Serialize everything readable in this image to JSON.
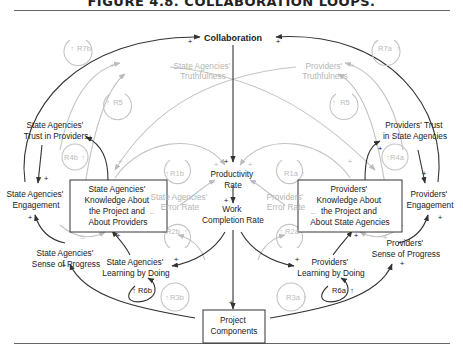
{
  "figure": {
    "title": "FIGURE 4.8. COLLABORATION LOOPS."
  },
  "nodes": {
    "collaboration": "Collaboration",
    "sa_truthfulness": [
      "State Agencies'",
      "Truthfulness"
    ],
    "pr_truthfulness": [
      "Providers'",
      "Truthfulness"
    ],
    "sa_trust": [
      "State Agencies'",
      "Trust in Providers"
    ],
    "pr_trust": [
      "Providers' Trust",
      "in State Agencies"
    ],
    "sa_engagement": [
      "State Agencies'",
      "Engagement"
    ],
    "pr_engagement": [
      "Providers'",
      "Engagement"
    ],
    "sa_knowledge": [
      "State Agencies'",
      "Knowledge About",
      "the Project and",
      "About Providers"
    ],
    "pr_knowledge": [
      "Providers'",
      "Knowledge About",
      "the Project and",
      "About State Agencies"
    ],
    "productivity": [
      "Productivity",
      "Rate"
    ],
    "work_completion": [
      "Work",
      "Completion Rate"
    ],
    "sa_error": [
      "State Agencies'",
      "Error Rate"
    ],
    "pr_error": [
      "Providers'",
      "Error Rate"
    ],
    "sa_progress": [
      "State Agencies'",
      "Sense of Progress"
    ],
    "pr_progress": [
      "Providers'",
      "Sense of Progress"
    ],
    "sa_learning": [
      "State Agencies'",
      "Learning by Doing"
    ],
    "pr_learning": [
      "Providers'",
      "Learning by Doing"
    ],
    "project_components": [
      "Project",
      "Components"
    ]
  },
  "loops": {
    "r7b": "R7b",
    "r7a": "R7a",
    "r5_left": "R5",
    "r5_right": "R5",
    "r4b": "R4b",
    "r4a": "R4a",
    "r1b": "R1b",
    "r1a": "R1a",
    "r2b": "R2b",
    "r2a": "R2a",
    "r3b": "R3b",
    "r3a": "R3a",
    "r6b": "R6b",
    "r6a": "R6a"
  },
  "polarity": {
    "plus": "+",
    "minus": "–"
  }
}
